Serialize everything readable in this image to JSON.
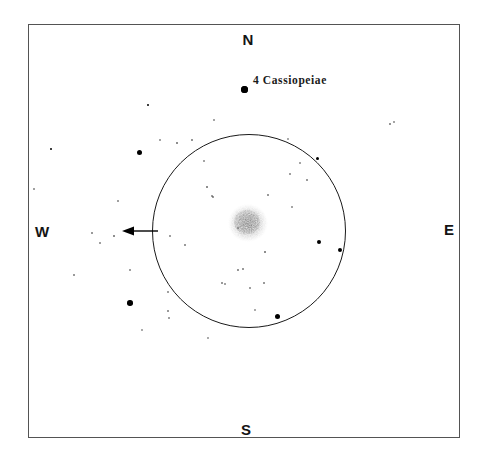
{
  "figure": {
    "type": "astronomical-sketch",
    "background_color": "#ffffff",
    "border_color": "#545454",
    "ink_color": "#000000"
  },
  "cardinals": {
    "north": "N",
    "south": "S",
    "west": "W",
    "east": "E"
  },
  "annotations": {
    "star_label": "4   Cassiopeiae"
  },
  "chart_data": {
    "type": "scatter",
    "title": "",
    "xlabel": "",
    "ylabel": "",
    "xlim": [
      28,
      460
    ],
    "ylim": [
      24,
      438
    ],
    "grid": false,
    "legend": "none",
    "field_of_view_circle": {
      "center_x": 249,
      "center_y": 231,
      "radius": 97
    },
    "diffuse_object": {
      "name": "comet-coma",
      "center_x": 248,
      "center_y": 224,
      "radius": 22,
      "appearance": "stippled-gray-diffuse"
    },
    "direction_arrow": {
      "from_x": 158,
      "from_y": 231,
      "to_x": 120,
      "to_y": 231,
      "points": "west"
    },
    "labeled_star": {
      "label": "4   Cassiopeiae",
      "x": 244,
      "y": 89,
      "size": 7
    },
    "stars": [
      {
        "x": 244,
        "y": 89,
        "size": 7.0
      },
      {
        "x": 139,
        "y": 152,
        "size": 5.0
      },
      {
        "x": 130,
        "y": 303,
        "size": 5.5
      },
      {
        "x": 277,
        "y": 316,
        "size": 5.0
      },
      {
        "x": 319,
        "y": 242,
        "size": 4.2
      },
      {
        "x": 340,
        "y": 250,
        "size": 4.0
      },
      {
        "x": 317,
        "y": 158,
        "size": 3.0
      },
      {
        "x": 51,
        "y": 149,
        "size": 2.4
      },
      {
        "x": 148,
        "y": 105,
        "size": 2.2
      },
      {
        "x": 177,
        "y": 143,
        "size": 2.0
      },
      {
        "x": 192,
        "y": 140,
        "size": 1.8
      },
      {
        "x": 207,
        "y": 187,
        "size": 2.0
      },
      {
        "x": 213,
        "y": 197,
        "size": 1.6
      },
      {
        "x": 212,
        "y": 196,
        "size": 1.5
      },
      {
        "x": 268,
        "y": 195,
        "size": 1.6
      },
      {
        "x": 238,
        "y": 228,
        "size": 1.8
      },
      {
        "x": 265,
        "y": 252,
        "size": 2.0
      },
      {
        "x": 238,
        "y": 270,
        "size": 1.8
      },
      {
        "x": 243,
        "y": 269,
        "size": 1.6
      },
      {
        "x": 222,
        "y": 283,
        "size": 1.6
      },
      {
        "x": 250,
        "y": 288,
        "size": 1.5
      },
      {
        "x": 264,
        "y": 283,
        "size": 1.6
      },
      {
        "x": 225,
        "y": 284,
        "size": 1.4
      },
      {
        "x": 185,
        "y": 245,
        "size": 1.6
      },
      {
        "x": 170,
        "y": 236,
        "size": 1.5
      },
      {
        "x": 114,
        "y": 236,
        "size": 2.0
      },
      {
        "x": 92,
        "y": 233,
        "size": 1.6
      },
      {
        "x": 100,
        "y": 243,
        "size": 1.5
      },
      {
        "x": 74,
        "y": 275,
        "size": 1.6
      },
      {
        "x": 130,
        "y": 270,
        "size": 1.5
      },
      {
        "x": 168,
        "y": 292,
        "size": 1.5
      },
      {
        "x": 168,
        "y": 311,
        "size": 1.6
      },
      {
        "x": 169,
        "y": 318,
        "size": 1.5
      },
      {
        "x": 118,
        "y": 201,
        "size": 1.5
      },
      {
        "x": 160,
        "y": 140,
        "size": 1.4
      },
      {
        "x": 290,
        "y": 174,
        "size": 1.5
      },
      {
        "x": 307,
        "y": 180,
        "size": 1.6
      },
      {
        "x": 292,
        "y": 207,
        "size": 1.4
      },
      {
        "x": 300,
        "y": 163,
        "size": 1.4
      },
      {
        "x": 390,
        "y": 124,
        "size": 1.8
      },
      {
        "x": 394,
        "y": 122,
        "size": 1.4
      },
      {
        "x": 34,
        "y": 189,
        "size": 1.5
      },
      {
        "x": 214,
        "y": 120,
        "size": 1.4
      },
      {
        "x": 204,
        "y": 161,
        "size": 1.4
      },
      {
        "x": 288,
        "y": 139,
        "size": 1.3
      },
      {
        "x": 208,
        "y": 338,
        "size": 1.3
      },
      {
        "x": 142,
        "y": 330,
        "size": 1.3
      },
      {
        "x": 255,
        "y": 310,
        "size": 1.3
      }
    ]
  }
}
